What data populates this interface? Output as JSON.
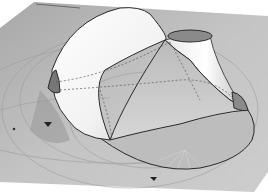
{
  "scene": {
    "description": "3D rendered tensile shell surface on ground plane",
    "colors": {
      "background": "#ffffff",
      "ground": "#b4b4b4",
      "ground_light": "#c8c8c8",
      "shadow": "#8e8e8e",
      "surface_light": "#f6f6f6",
      "surface_mid": "#d8d8d8",
      "surface_dark": "#9a9a9a",
      "edge": "#2a2a2a",
      "opening_fill": "#7a7a7a"
    }
  }
}
